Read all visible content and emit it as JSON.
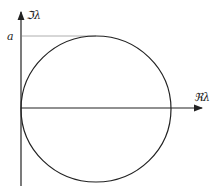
{
  "diagram": {
    "title": "",
    "labels": {
      "imag_axis": "ℑλ",
      "real_axis": "ℜλ",
      "radius_marker": "a"
    },
    "shape": "circle tangent to imaginary axis at origin",
    "colors": {
      "stroke": "#222222",
      "guide": "#999999",
      "background": "#ffffff"
    }
  }
}
